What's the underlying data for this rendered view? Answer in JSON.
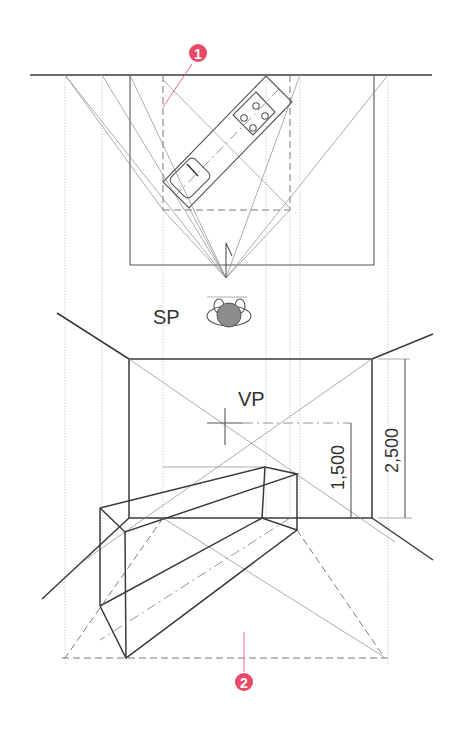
{
  "figure": {
    "labels": {
      "station_point": "SP",
      "vanishing_point": "VP",
      "eye_height": "1,500",
      "ceiling_height": "2,500"
    },
    "markers": [
      {
        "id": "marker-1",
        "text": "1",
        "color": "#e84a66"
      },
      {
        "id": "marker-2",
        "text": "2",
        "color": "#e84a66"
      }
    ],
    "plan": {
      "object": "kitchen counter (rotated ~45°)",
      "features": [
        "sink",
        "faucet",
        "4-burner cooktop"
      ]
    },
    "colors": {
      "line": "#3a3a3a",
      "construction": "#8a8a8a",
      "accent": "#e84a66",
      "background": "#ffffff"
    }
  }
}
